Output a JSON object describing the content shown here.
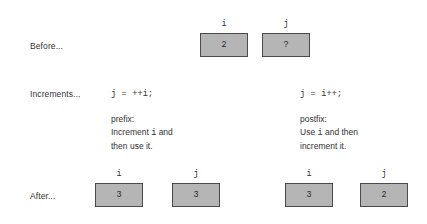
{
  "diagram": {
    "background_color": "#ffffff",
    "box_fill_color": "#b5b5b5",
    "box_border_color": "#4a4a4a",
    "text_color": "#333333"
  },
  "rows": {
    "before_label": "Before...",
    "increments_label": "Increments...",
    "after_label": "After..."
  },
  "before": {
    "boxes": [
      {
        "name": "i",
        "value": "2"
      },
      {
        "name": "j",
        "value": "?"
      }
    ]
  },
  "prefix": {
    "code": "j = ++i;",
    "note_title": "prefix:",
    "note_line_2_before": "Increment ",
    "note_line_2_mono": "i",
    "note_line_2_after": " and",
    "note_line_3": "then use it.",
    "boxes": [
      {
        "name": "i",
        "value": "3"
      },
      {
        "name": "j",
        "value": "3"
      }
    ]
  },
  "postfix": {
    "code": "j = i++;",
    "note_title": "postfix:",
    "note_line_2_before": "Use ",
    "note_line_2_mono": "i",
    "note_line_2_after": " and then",
    "note_line_3": "increment it.",
    "boxes": [
      {
        "name": "i",
        "value": "3"
      },
      {
        "name": "j",
        "value": "2"
      }
    ]
  }
}
